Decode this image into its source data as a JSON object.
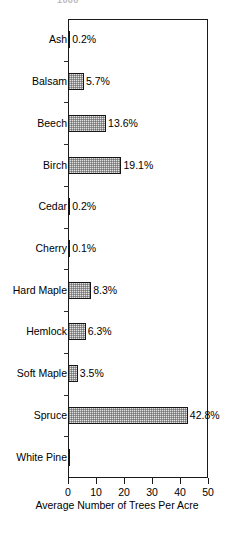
{
  "top_clipped_text": "1000",
  "chart_data": {
    "type": "bar",
    "orientation": "horizontal",
    "title": "",
    "xlabel": "Average Number of Trees Per Acre",
    "ylabel": "",
    "xlim": [
      0,
      50
    ],
    "xticks": [
      0,
      10,
      20,
      30,
      40,
      50
    ],
    "xtick_labels": [
      "0",
      "10",
      "20",
      "30",
      "40",
      "50"
    ],
    "grid": false,
    "legend": "none",
    "categories": [
      "Ash",
      "Balsam",
      "Beech",
      "Birch",
      "Cedar",
      "Cherry",
      "Hard Maple",
      "Hemlock",
      "Soft Maple",
      "Spruce",
      "White Pine"
    ],
    "values": [
      0.2,
      5.7,
      13.6,
      19.1,
      0.2,
      0.1,
      8.3,
      6.3,
      3.5,
      42.8,
      0.3
    ],
    "value_labels": [
      "0.2%",
      "5.7%",
      "13.6%",
      "19.1%",
      "0.2%",
      "0.1%",
      "8.3%",
      "6.3%",
      "3.5%",
      "42.8%",
      ""
    ],
    "bar_fill": "#e2e2e2",
    "bar_edge": "#161616"
  }
}
